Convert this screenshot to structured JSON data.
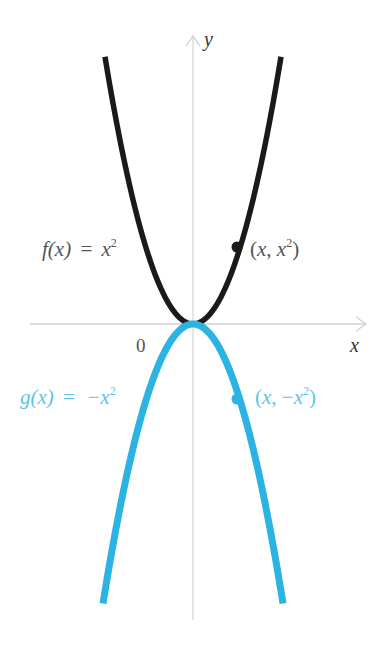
{
  "figure": {
    "axes": {
      "x_label": "x",
      "y_label": "y",
      "origin_label": "0",
      "axis_color": "#cfcfcf"
    },
    "curves": [
      {
        "name": "f",
        "label": "f(x) = x²",
        "label_parts": {
          "lhs": "f(x)",
          "eq": "=",
          "rhs": "x",
          "exp": "2"
        },
        "color": "#1a1a1a",
        "label_color": "#555555",
        "point_label": "(x, x²)",
        "direction": "up"
      },
      {
        "name": "g",
        "label": "g(x) = −x²",
        "label_parts": {
          "lhs": "g(x)",
          "eq": "=",
          "rhs": "−x",
          "exp": "2"
        },
        "color": "#2bb3e3",
        "label_color": "#5cc4ea",
        "point_label": "(x, −x²)",
        "direction": "down"
      }
    ]
  }
}
